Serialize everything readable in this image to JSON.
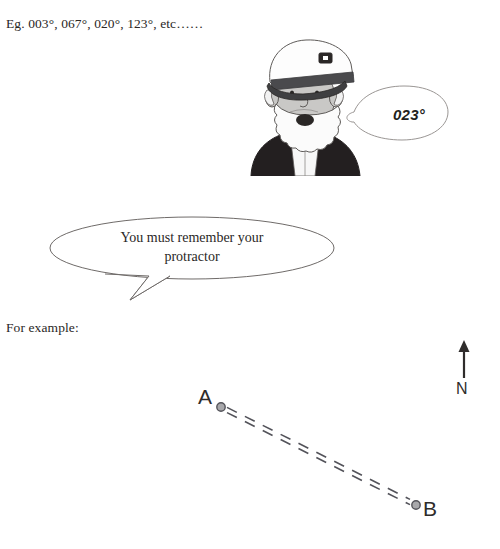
{
  "page": {
    "background_color": "#ffffff",
    "text_color": "#2a2726"
  },
  "text_lines": {
    "examples": "Eg. 003°, 067°, 020°, 123°, etc……",
    "for_example": "For example:"
  },
  "captain": {
    "name": "sea-captain-illustration",
    "hat_band_color": "#3f3f41",
    "jacket_color": "#231f20",
    "skin_color": "#c9c8c6",
    "beard_color": "#fbfbfb"
  },
  "bubbles": {
    "bearing": {
      "text": "023°",
      "outline_color": "#9a9694"
    },
    "protractor": {
      "text": "You must remember your protractor",
      "outline_color": "#6f6b69"
    }
  },
  "diagram": {
    "point_a_label": "A",
    "point_b_label": "B",
    "north_label": "N",
    "line_style": "double-dashed",
    "line_color": "#53535a",
    "marker_fill": "#a8a8ab",
    "marker_stroke": "#53535a",
    "point_a": {
      "x": 221,
      "y": 77
    },
    "point_b": {
      "x": 416,
      "y": 175
    },
    "north_arrow": {
      "x": 464,
      "y_top": 14,
      "y_bottom": 48
    }
  }
}
